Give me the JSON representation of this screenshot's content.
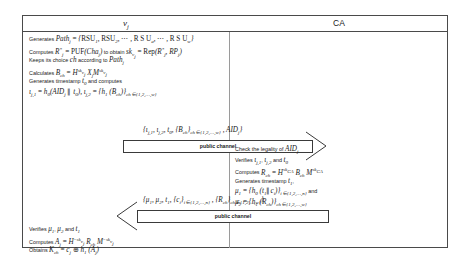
{
  "diagram": {
    "columns": {
      "left_label": "v",
      "left_label_sub": "j",
      "right_label": "CA"
    },
    "channel_label": "public channel",
    "vehicle_steps_phase1": [
      "Generates Path_j = {RSU_1, RSU_2, ..., RSU_a, ..., RSU_w}",
      "Computes R*_j = PUF(Cha_j) to obtain sk_vj = Rep(R*_j, RP_j)",
      "Keeps its choice ch according to Path_j",
      "Calculates B_ch = H^sk_vj X_j M^sk_vj",
      "Generates timestamp t_0 and computes",
      "i_j,1 = h_0(AID_j || t_0), i_j,2 = {h_1(B_ch)}_ch in {1,2,...,w}"
    ],
    "vehicle_steps_phase2": [
      "Verifies mu_1, mu_2 and t_1",
      "Computes A_j = H^-sk_vj R_ch M^-sk_vj",
      "Obtains K_ch = c_j XOR h_1(A_j)"
    ],
    "ca_steps_phase1": [
      "Check the legality of AID_j",
      "Verifies i_j,1, i_j,2 and t_0",
      "Computes R_ch = H^sk_CA B_ch M^sk_CA",
      "Generates timestamp t_1,"
    ],
    "ca_steps_phase2": [
      "mu_1 = {h_0(t_1||c_i)}_i in {1,2,...,n} and",
      "mu_2 = {h_1(R_ch)}_ch in {1,2,...,w}"
    ],
    "message_1": "{i_j,1, i_j,2, t_0, {B_ch}_ch in {1,2,...,w}, AID_j}",
    "message_2": "{mu_1, mu_2, t_1, {c_i}_i in {1,2,...,n}, {R_ch}_ch in {1,2,...,w}}",
    "colors": {
      "border": "#4a4a4a",
      "text": "#1a1a1a",
      "background": "#ffffff"
    }
  }
}
